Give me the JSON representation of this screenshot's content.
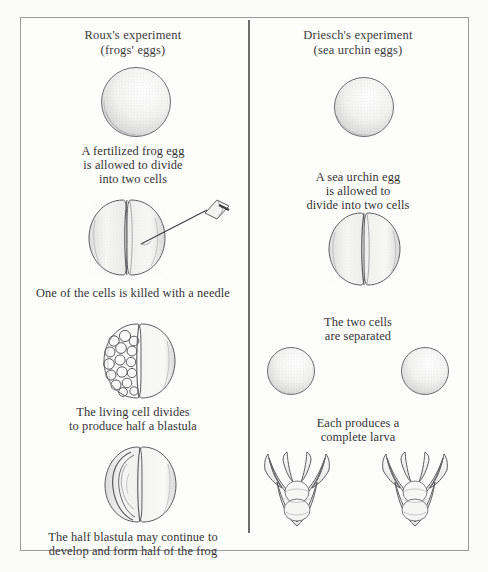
{
  "figure": {
    "border_color": "#9a9a9a",
    "divider_color": "#6d6d70",
    "background": "#fdfdfb"
  },
  "columns": [
    {
      "id": "roux",
      "header_line1": "Roux's experiment",
      "header_line2": "(frogs' eggs)",
      "stages": [
        {
          "id": "fertilized-egg",
          "illustration": "single-stippled-sphere",
          "caption_lines": [
            "A fertilized frog egg",
            "is allowed to divide",
            "into two cells"
          ]
        },
        {
          "id": "needle-kill",
          "illustration": "two-cell-embryo-with-needle",
          "caption_lines": [
            "One of the cells is killed with a needle"
          ]
        },
        {
          "id": "half-blastula",
          "illustration": "half-divided-blastula",
          "caption_lines": [
            "The living cell divides",
            "to produce half a blastula"
          ]
        },
        {
          "id": "half-frog",
          "illustration": "half-embryo-neural-folds",
          "caption_lines": [
            "The half blastula may continue to",
            "develop and form half of the frog"
          ]
        }
      ]
    },
    {
      "id": "driesch",
      "header_line1": "Driesch's experiment",
      "header_line2": "(sea urchin eggs)",
      "stages": [
        {
          "id": "urchin-egg",
          "illustration": "single-stippled-sphere",
          "caption_lines": [
            "A sea urchin egg",
            "is allowed to",
            "divide into two cells"
          ]
        },
        {
          "id": "urchin-two-cell",
          "illustration": "two-cell-embryo",
          "caption_lines": [
            "The two cells",
            "are separated"
          ]
        },
        {
          "id": "separated-cells",
          "illustration": "two-separate-spheres",
          "caption_lines": [
            "Each produces a",
            "complete larva"
          ]
        },
        {
          "id": "two-larvae",
          "illustration": "two-pluteus-larvae",
          "caption_lines": []
        }
      ]
    }
  ]
}
